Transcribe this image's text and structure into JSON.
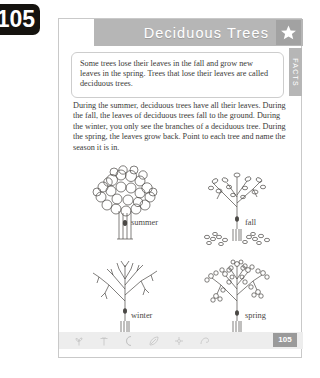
{
  "corner_badge": {
    "page_number": "105"
  },
  "header": {
    "title": "Deciduous Trees",
    "star_icon": "star-icon"
  },
  "side_tab": {
    "label": "FACTS"
  },
  "fact_box": {
    "text": "Some trees lose their leaves in the fall and grow new leaves in the spring. Trees that lose their leaves are called deciduous trees."
  },
  "instructions": {
    "text": "During the summer, deciduous trees have all their leaves. During the fall, the leaves of deciduous trees fall to the ground. During the winter, you only see the branches of a deciduous tree. During the spring, the leaves grow back. Point to each tree and name the season it is in."
  },
  "trees": [
    {
      "season": "summer",
      "state": "full-leaves"
    },
    {
      "season": "fall",
      "state": "sparse-leaves-falling"
    },
    {
      "season": "winter",
      "state": "bare-branches"
    },
    {
      "season": "spring",
      "state": "new-small-leaves"
    }
  ],
  "footer": {
    "page_number": "105",
    "decor_icons": [
      "plant-icon",
      "sprout-icon",
      "moon-icon",
      "leaf-icon",
      "flower-icon",
      "swirl-icon"
    ]
  },
  "colors": {
    "banner_gray": "#b6b6b6",
    "badge_black": "#15130f",
    "text_gray": "#3b3a38",
    "footer_gray": "#ededed"
  }
}
